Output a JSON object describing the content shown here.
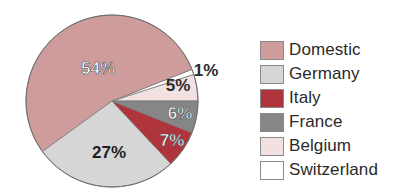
{
  "chart_data": {
    "type": "pie",
    "title": "",
    "start_angle_deg": 0,
    "direction": "counterclockwise",
    "slices": [
      {
        "name": "Belgium",
        "value": 5,
        "label": "5%",
        "color": "#f3e1e1",
        "label_color": "#2a2a2a",
        "label_pos": [
          178,
          91
        ]
      },
      {
        "name": "Switzerland",
        "value": 1,
        "label": "1%",
        "color": "#ffffff",
        "label_color": "#2a2a2a",
        "label_pos": [
          206,
          76
        ]
      },
      {
        "name": "Domestic",
        "value": 54,
        "label": "54%",
        "color": "#cf9c9c",
        "label_color": "#ffffff",
        "label_pos": [
          98,
          74
        ]
      },
      {
        "name": "Germany",
        "value": 27,
        "label": "27%",
        "color": "#d6d6d6",
        "label_color": "#1e1e1e",
        "label_pos": [
          109,
          158
        ]
      },
      {
        "name": "Italy",
        "value": 7,
        "label": "7%",
        "color": "#b0343c",
        "label_color": "#ffffff",
        "label_pos": [
          172,
          146
        ]
      },
      {
        "name": "France",
        "value": 6,
        "label": "6%",
        "color": "#868686",
        "label_color": "#ffffff",
        "label_pos": [
          180,
          119
        ]
      }
    ],
    "legend_position": "right"
  },
  "legend": {
    "items": [
      {
        "label": "Domestic",
        "color": "#cf9c9c"
      },
      {
        "label": "Germany",
        "color": "#d6d6d6"
      },
      {
        "label": "Italy",
        "color": "#b0343c"
      },
      {
        "label": "France",
        "color": "#868686"
      },
      {
        "label": "Belgium",
        "color": "#f3e1e1"
      },
      {
        "label": "Switzerland",
        "color": "#ffffff"
      }
    ]
  }
}
